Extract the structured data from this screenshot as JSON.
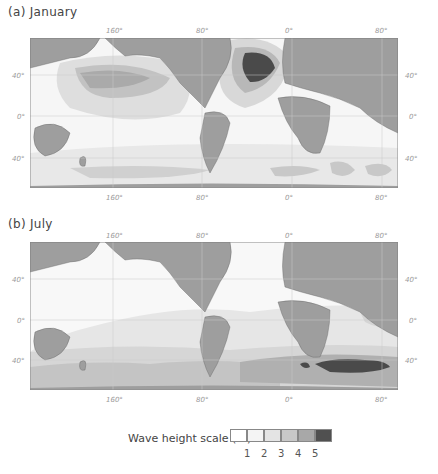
{
  "panels": [
    {
      "title": "(a) January",
      "top_lon_ticks": [
        "160°",
        "80°",
        "0°",
        "80°"
      ],
      "bottom_lon_ticks": [
        "160°",
        "80°",
        "0°",
        "80°"
      ],
      "left_lat_ticks": [
        "40°",
        "0°",
        "40°"
      ],
      "right_lat_ticks": [
        "40°",
        "0°",
        "40°"
      ]
    },
    {
      "title": "(b) July",
      "top_lon_ticks": [
        "160°",
        "80°",
        "0°",
        "80°"
      ],
      "bottom_lon_ticks": [
        "160°",
        "80°",
        "0°",
        "80°"
      ],
      "left_lat_ticks": [
        "40°",
        "0°",
        "40°"
      ],
      "right_lat_ticks": [
        "40°",
        "0°",
        "40°"
      ]
    }
  ],
  "legend": {
    "label": "Wave height scale (m)",
    "classes": [
      {
        "color": "#ffffff"
      },
      {
        "color": "#f4f4f4"
      },
      {
        "color": "#e4e4e4"
      },
      {
        "color": "#c8c8c8"
      },
      {
        "color": "#a8a8a8"
      },
      {
        "color": "#505050"
      }
    ],
    "ticks": [
      "1",
      "2",
      "3",
      "4",
      "5"
    ]
  },
  "colors": {
    "land": "#9e9e9e",
    "ocean_low": "#f7f7f7",
    "grid": "#c8c8c8",
    "frame": "#888888"
  }
}
